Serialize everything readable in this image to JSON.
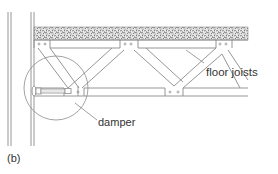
{
  "diagram": {
    "panel_label": "(b)",
    "labels": {
      "floor_joists": "floor joists",
      "damper": "damper"
    },
    "colors": {
      "line": "#8a8a8a",
      "slab_fill": "#d8d8d8",
      "text": "#333333",
      "background": "#ffffff"
    },
    "components": [
      "wall",
      "concrete slab",
      "floor joists (truss)",
      "damper",
      "detail circle"
    ]
  }
}
